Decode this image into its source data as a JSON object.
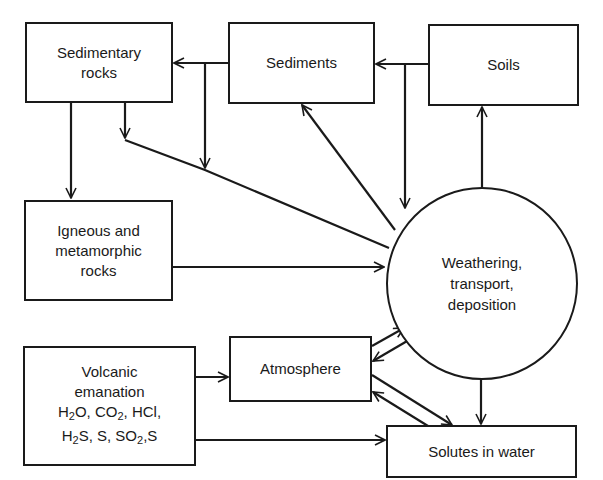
{
  "diagram": {
    "nodes": {
      "sedimentary_rocks": {
        "line1": "Sedimentary",
        "line2": "rocks"
      },
      "sediments": {
        "label": "Sediments"
      },
      "soils": {
        "label": "Soils"
      },
      "igneous": {
        "line1": "Igneous and",
        "line2": "metamorphic",
        "line3": "rocks"
      },
      "weathering": {
        "line1": "Weathering,",
        "line2": "transport,",
        "line3": "deposition"
      },
      "volcanic": {
        "line1": "Volcanic",
        "line2": "emanation",
        "gases_row1": [
          "H",
          "2",
          "O, CO",
          "2",
          ", HCl,"
        ],
        "gases_row2": [
          "H",
          "2",
          "S, S, SO",
          "2",
          ",S"
        ]
      },
      "atmosphere": {
        "label": "Atmosphere"
      },
      "solutes": {
        "label": "Solutes in water"
      }
    },
    "edges": [
      {
        "from": "Sediments",
        "to": "Sedimentary rocks"
      },
      {
        "from": "Soils",
        "to": "Sediments"
      },
      {
        "from": "Sedimentary rocks",
        "to": "Igneous and metamorphic rocks"
      },
      {
        "from": "Sedimentary rocks",
        "to": "Weathering, transport, deposition"
      },
      {
        "from": "Sediments",
        "to": "Weathering, transport, deposition"
      },
      {
        "from": "Soils",
        "to": "Weathering, transport, deposition"
      },
      {
        "from": "Weathering, transport, deposition",
        "to": "Sediments"
      },
      {
        "from": "Weathering, transport, deposition",
        "to": "Soils"
      },
      {
        "from": "Igneous and metamorphic rocks",
        "to": "Weathering, transport, deposition"
      },
      {
        "from": "Volcanic emanation",
        "to": "Atmosphere"
      },
      {
        "from": "Volcanic emanation",
        "to": "Solutes in water"
      },
      {
        "from": "Atmosphere",
        "to": "Weathering, transport, deposition"
      },
      {
        "from": "Weathering, transport, deposition",
        "to": "Atmosphere"
      },
      {
        "from": "Atmosphere",
        "to": "Solutes in water"
      },
      {
        "from": "Solutes in water",
        "to": "Atmosphere"
      },
      {
        "from": "Weathering, transport, deposition",
        "to": "Solutes in water"
      }
    ]
  }
}
